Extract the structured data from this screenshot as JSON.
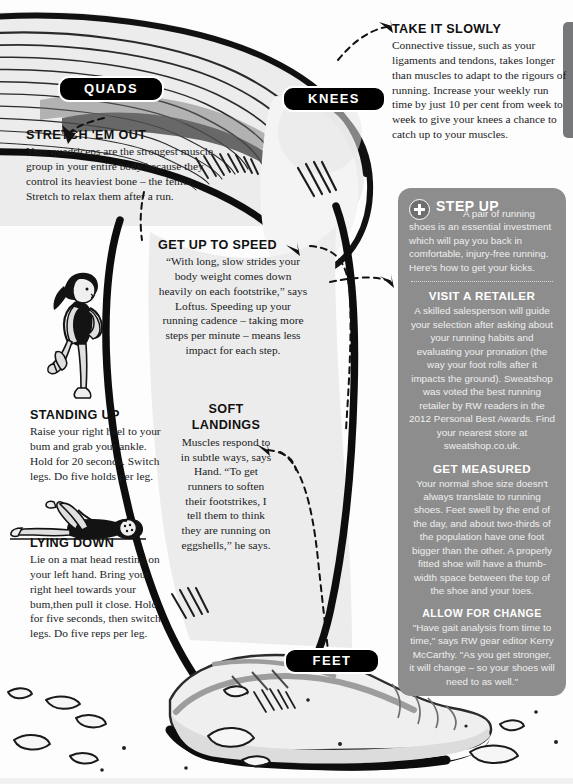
{
  "labels": {
    "quads": "QUADS",
    "knees": "KNEES",
    "feet": "FEET"
  },
  "callouts": {
    "stretch_em_out": {
      "heading": "STRETCH 'EM OUT",
      "body": "Your quadriceps are the strongest muscle group in your entire body because they control its heaviest bone – the femur. Stretch to relax them after a run."
    },
    "take_it_slowly": {
      "heading": "TAKE IT SLOWLY",
      "body": "Connective tissue, such as your ligaments and tendons, takes longer than muscles to adapt to the rigours of running. Increase your weekly run time by just 10 per cent from week to week to give your knees a chance to catch up to your muscles."
    },
    "get_up_to_speed": {
      "heading": "GET UP TO SPEED",
      "body": "“With long, slow strides your body weight comes down heavily on each footstrike,” says Loftus. Speeding up your running cadence – taking more steps per minute – means less impact for each step."
    },
    "soft_landings": {
      "heading_line1": "SOFT",
      "heading_line2": "LANDINGS",
      "body": "Muscles respond to in subtle ways, says Hand. “To get runners to soften their footstrikes, I tell them to think they are running on eggshells,” he says."
    },
    "standing_up": {
      "heading": "STANDING UP",
      "body": "Raise your right heel to your bum and grab your ankle. Hold for 20 seconds. Switch legs. Do five holds per leg."
    },
    "lying_down": {
      "heading": "LYING DOWN",
      "body": "Lie on a mat head resting on your left hand. Bring your right heel towards your bum,then pull it close. Hold for five seconds, then switch legs. Do five reps per leg."
    }
  },
  "panel": {
    "title": "STEP UP",
    "intro": "A pair of running shoes is an essential investment which will pay you back in comfortable, injury-free running. Here's how to get your kicks.",
    "sections": [
      {
        "heading": "VISIT A RETAILER",
        "body": "A skilled salesperson will guide your selection after asking about your running habits and evaluating your pronation (the way your foot rolls after it impacts the ground). Sweatshop was voted the best running retailer by RW readers in the 2012 Personal Best Awards. Find your nearest store at sweatshop.co.uk."
      },
      {
        "heading": "GET MEASURED",
        "body": "Your normal shoe size doesn't always translate to running shoes. Feet swell by the end of the day, and about two-thirds of the population have one foot bigger than the other. A properly fitted shoe will have a thumb-width space between the top of the shoe and your toes."
      },
      {
        "heading": "ALLOW FOR CHANGE",
        "body": "\"Have gait analysis from time to time,\" says RW gear editor Kerry McCarthy. \"As you get stronger, it will change – so your shoes will need to as well.\""
      }
    ]
  },
  "colors": {
    "panel_bg": "#8d8d8d",
    "pill_bg": "#000000",
    "pill_text": "#ffffff",
    "body_text": "#1b1c1e",
    "leg_fill": "#ebebeb",
    "shadow_fill": "#c9c9c9"
  },
  "illustrations": {
    "standing_stretch": "woman-standing-quad-stretch",
    "lying_stretch": "woman-lying-quad-stretch",
    "main": "runner-leg-and-shoe-on-eggshells"
  }
}
